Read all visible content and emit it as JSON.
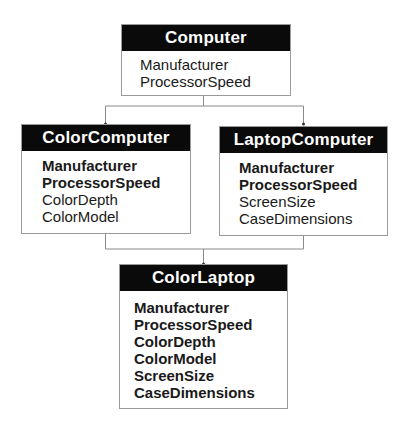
{
  "diagram": {
    "classes": [
      {
        "id": "computer",
        "name": "Computer",
        "attributes": [
          {
            "label": "Manufacturer",
            "inherited": false
          },
          {
            "label": "ProcessorSpeed",
            "inherited": false
          }
        ]
      },
      {
        "id": "color-computer",
        "name": "ColorComputer",
        "attributes": [
          {
            "label": "Manufacturer",
            "inherited": true
          },
          {
            "label": "ProcessorSpeed",
            "inherited": true
          },
          {
            "label": "ColorDepth",
            "inherited": false
          },
          {
            "label": "ColorModel",
            "inherited": false
          }
        ]
      },
      {
        "id": "laptop-computer",
        "name": "LaptopComputer",
        "attributes": [
          {
            "label": "Manufacturer",
            "inherited": true
          },
          {
            "label": "ProcessorSpeed",
            "inherited": true
          },
          {
            "label": "ScreenSize",
            "inherited": false
          },
          {
            "label": "CaseDimensions",
            "inherited": false
          }
        ]
      },
      {
        "id": "color-laptop",
        "name": "ColorLaptop",
        "attributes": [
          {
            "label": "Manufacturer",
            "inherited": true
          },
          {
            "label": "ProcessorSpeed",
            "inherited": true
          },
          {
            "label": "ColorDepth",
            "inherited": true
          },
          {
            "label": "ColorModel",
            "inherited": true
          },
          {
            "label": "ScreenSize",
            "inherited": true
          },
          {
            "label": "CaseDimensions",
            "inherited": true
          }
        ]
      }
    ],
    "edges": [
      {
        "from": "computer",
        "to": "color-computer"
      },
      {
        "from": "computer",
        "to": "laptop-computer"
      },
      {
        "from": "color-computer",
        "to": "color-laptop"
      },
      {
        "from": "laptop-computer",
        "to": "color-laptop"
      }
    ]
  }
}
